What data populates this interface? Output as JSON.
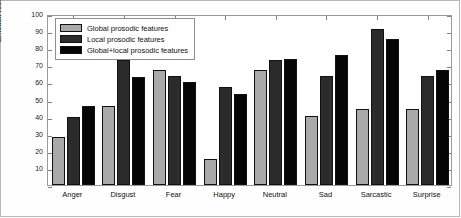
{
  "chart_data": {
    "type": "bar",
    "title": "",
    "xlabel": "",
    "ylabel": "Emotion recognition (%)",
    "ylim": [
      0,
      100
    ],
    "yticks": [
      0,
      10,
      20,
      30,
      40,
      50,
      60,
      70,
      80,
      90,
      100
    ],
    "ytick_labels": [
      "",
      "10",
      "20",
      "30",
      "40",
      "50",
      "60",
      "70",
      "80",
      "90",
      "100"
    ],
    "grid": false,
    "legend_position": "upper left",
    "categories": [
      "Anger",
      "Disgust",
      "Fear",
      "Happy",
      "Neutral",
      "Sad",
      "Sarcastic",
      "Surprise"
    ],
    "series": [
      {
        "name": "Global prosodic features",
        "color": "#a9a9a9",
        "values": [
          28,
          46,
          67,
          15,
          67,
          40.5,
          44.5,
          44.5
        ]
      },
      {
        "name": "Local prosodic features",
        "color": "#2b2b2b",
        "values": [
          40,
          73,
          63.5,
          57.5,
          73,
          63.5,
          91,
          64
        ]
      },
      {
        "name": "Global+local prosodic features",
        "color": "#050505",
        "values": [
          46,
          63,
          60.5,
          53,
          73.5,
          76,
          85.5,
          67.5
        ]
      }
    ]
  }
}
